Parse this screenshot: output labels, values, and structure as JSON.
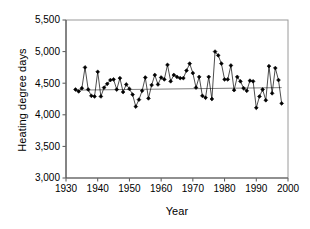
{
  "chart_data": {
    "type": "line",
    "title": "",
    "xlabel": "Year",
    "ylabel": "Heating degree days",
    "xlim": [
      1930,
      2000
    ],
    "ylim": [
      3000,
      5500
    ],
    "xticks": [
      1930,
      1940,
      1950,
      1960,
      1970,
      1980,
      1990,
      2000
    ],
    "yticks": [
      3000,
      3500,
      4000,
      4500,
      5000,
      5500
    ],
    "xtick_labels": [
      "1930",
      "1940",
      "1950",
      "1960",
      "1970",
      "1980",
      "1990",
      "2000"
    ],
    "ytick_labels": [
      "3,000",
      "3,500",
      "4,000",
      "4,500",
      "5,000",
      "5,500"
    ],
    "grid": false,
    "legend": false,
    "legend_position": "none",
    "marker": "filled-diamond",
    "series": [
      {
        "name": "Heating degree days",
        "color": "#000000",
        "x": [
          1933,
          1934,
          1935,
          1936,
          1937,
          1938,
          1939,
          1940,
          1941,
          1942,
          1943,
          1944,
          1945,
          1946,
          1947,
          1948,
          1949,
          1950,
          1951,
          1952,
          1953,
          1954,
          1955,
          1956,
          1957,
          1958,
          1959,
          1960,
          1961,
          1962,
          1963,
          1964,
          1965,
          1966,
          1967,
          1968,
          1969,
          1970,
          1971,
          1972,
          1973,
          1974,
          1975,
          1976,
          1977,
          1978,
          1979,
          1980,
          1981,
          1982,
          1983,
          1984,
          1985,
          1986,
          1987,
          1988,
          1989,
          1990,
          1991,
          1992,
          1993,
          1994,
          1995,
          1996,
          1997,
          1998
        ],
        "y": [
          4400,
          4370,
          4420,
          4750,
          4400,
          4300,
          4290,
          4680,
          4290,
          4430,
          4490,
          4550,
          4560,
          4400,
          4580,
          4360,
          4480,
          4410,
          4320,
          4130,
          4240,
          4380,
          4590,
          4260,
          4470,
          4630,
          4480,
          4590,
          4560,
          4790,
          4530,
          4630,
          4600,
          4580,
          4580,
          4700,
          4810,
          4660,
          4430,
          4600,
          4300,
          4270,
          4600,
          4250,
          5000,
          4940,
          4810,
          4560,
          4560,
          4780,
          4390,
          4600,
          4530,
          4420,
          4380,
          4540,
          4530,
          4110,
          4290,
          4400,
          4230,
          4770,
          4340,
          4740,
          4550,
          4180
        ]
      }
    ],
    "trendline": {
      "name": "linear trend",
      "color": "#808080",
      "x": [
        1933,
        1998
      ],
      "y": [
        4390,
        4430
      ]
    }
  }
}
